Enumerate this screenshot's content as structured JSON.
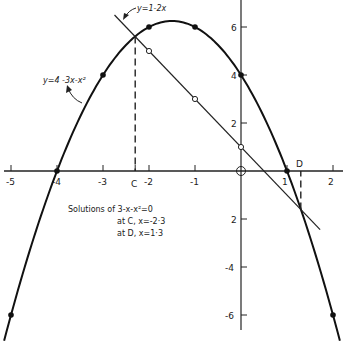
{
  "chart_data": {
    "type": "line",
    "title": "",
    "xlabel": "",
    "ylabel": "",
    "xlim": [
      -5.2,
      2.3
    ],
    "ylim": [
      -6.6,
      7.1
    ],
    "grid": false,
    "x_ticks": [
      -5,
      -4,
      -3,
      -2,
      -1,
      0,
      1,
      2
    ],
    "x_tick_labels": [
      "-5",
      "-4",
      "-3",
      "-2",
      "-1",
      "O",
      "1",
      "2"
    ],
    "y_ticks": [
      6,
      4,
      2,
      -2,
      -4,
      -6
    ],
    "y_tick_labels": [
      "6",
      "4",
      "2",
      "2",
      "-4",
      "-6"
    ],
    "series": [
      {
        "name": "y=4-3x-x²",
        "equation": "y = 4 - 3x - x^2",
        "style": "solid thick curve, filled dots",
        "x": [
          -5,
          -4,
          -3,
          -2,
          -1,
          0,
          1,
          2
        ],
        "values": [
          -6,
          0,
          4,
          6,
          6,
          4,
          0,
          -6
        ]
      },
      {
        "name": "y=1-2x",
        "equation": "y = 1 - 2x",
        "style": "solid thin line, open dots",
        "x": [
          -2,
          -1,
          0
        ],
        "values": [
          5,
          3,
          1
        ]
      }
    ],
    "intersections": [
      {
        "label": "C",
        "x": -2.3,
        "y": 5.6
      },
      {
        "label": "D",
        "x": 1.3,
        "y": -1.6
      }
    ],
    "annotations": {
      "curve_label": "y=4 -3x-x²",
      "line_label": "y=1-2x",
      "point_c_label": "C",
      "point_d_label": "D",
      "solutions_title": "Solutions of 3-x-x²=0",
      "solution_c": "at C, x=-2·3",
      "solution_d": "at D, x=1·3"
    }
  }
}
